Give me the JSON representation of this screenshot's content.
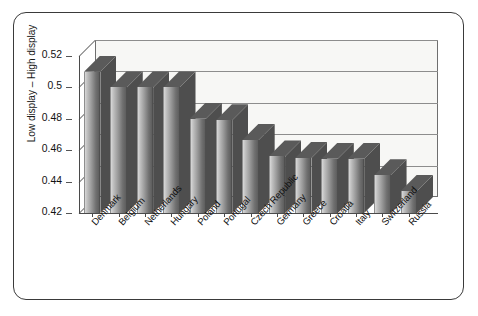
{
  "chart_data": {
    "type": "bar",
    "title": "",
    "subtitle": "",
    "xlabel": "",
    "ylabel": "Low display – High display",
    "categories": [
      "Denmark",
      "Belgium",
      "Netherlands",
      "Hungary",
      "Poland",
      "Portugal",
      "Czech Republic",
      "Germany",
      "Greece",
      "Croatia",
      "Italy",
      "Switzerland",
      "Russia"
    ],
    "values": [
      0.51,
      0.5,
      0.5,
      0.5,
      0.48,
      0.479,
      0.4665,
      0.456,
      0.455,
      0.4545,
      0.4545,
      0.444,
      0.434
    ],
    "ylim": [
      0.42,
      0.52
    ],
    "ytick_labels": [
      "0.52",
      "0.5",
      "0.48",
      "0.46",
      "0.44",
      "0.42"
    ],
    "ytick_values": [
      0.52,
      0.5,
      0.48,
      0.46,
      0.44,
      0.42
    ],
    "grid": true,
    "legend": false,
    "legend_position": "none",
    "style": "3d-bar-grayscale",
    "series": [
      {
        "name": "Low display – High display",
        "values": [
          0.51,
          0.5,
          0.5,
          0.5,
          0.48,
          0.479,
          0.4665,
          0.456,
          0.455,
          0.4545,
          0.4545,
          0.444,
          0.434
        ]
      }
    ],
    "annotations": []
  },
  "colors": {
    "bar_light": "#d8d8d8",
    "bar_dark": "#5e5e5e",
    "bar_top": "#5a5a5a",
    "bar_side": "#4e4e4e",
    "plot_background": "#f7f7f5",
    "grid": "#8d8d8d",
    "frame": "#3a3a3a",
    "text": "#111111"
  }
}
